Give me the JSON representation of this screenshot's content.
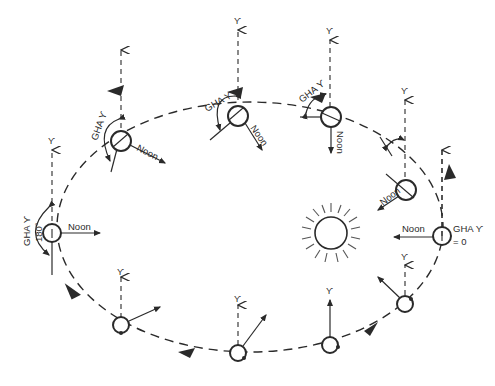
{
  "figure": {
    "header_text_cut_off": "",
    "aries_symbol": "ϒ",
    "noon_label": "Noon",
    "gha_label": "GHA ϒ",
    "gha_180_label": "180°",
    "gha_zero_label": "GHA ϒ",
    "gha_zero_value": "= 0",
    "colors": {
      "ink": "#2a2a2a",
      "background": "#ffffff"
    }
  },
  "positions": [
    {
      "id": "right",
      "label": "Noon",
      "gha": "GHA ϒ = 0"
    },
    {
      "id": "upper-right",
      "label": "Noon"
    },
    {
      "id": "top-right",
      "label": "Noon",
      "gha": "GHA ϒ"
    },
    {
      "id": "top-center",
      "label": "Noon",
      "gha": "GHA ϒ"
    },
    {
      "id": "upper-left",
      "label": "Noon",
      "gha": "GHA ϒ"
    },
    {
      "id": "left",
      "label": "Noon",
      "gha": "GHA ϒ 180°"
    },
    {
      "id": "lower-left",
      "label": ""
    },
    {
      "id": "bottom-left",
      "label": ""
    },
    {
      "id": "bottom-right",
      "label": ""
    },
    {
      "id": "lower-right",
      "label": ""
    }
  ]
}
